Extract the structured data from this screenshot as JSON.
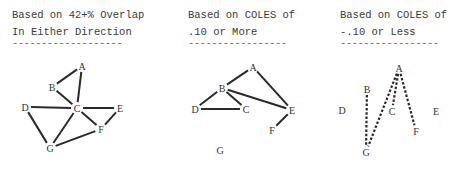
{
  "panels": [
    {
      "title_line1": "Based on 42+% Overlap",
      "title_line2": "In Either Direction",
      "underline": "-------------------",
      "x": 12,
      "line_style": "solid",
      "nodes": {
        "A": [
          82,
          66
        ],
        "B": [
          52,
          87
        ],
        "C": [
          77,
          108
        ],
        "D": [
          25,
          107
        ],
        "E": [
          120,
          108
        ],
        "F": [
          101,
          129
        ],
        "G": [
          50,
          148
        ]
      },
      "edges": [
        [
          "B",
          "A"
        ],
        [
          "A",
          "C"
        ],
        [
          "B",
          "C"
        ],
        [
          "D",
          "C"
        ],
        [
          "C",
          "E"
        ],
        [
          "D",
          "G"
        ],
        [
          "C",
          "G"
        ],
        [
          "C",
          "F"
        ],
        [
          "E",
          "F"
        ],
        [
          "G",
          "F"
        ]
      ]
    },
    {
      "title_line1": "Based on COLES of",
      "title_line2": ".10 or More",
      "underline": "-----------------",
      "x": 188,
      "line_style": "solid",
      "nodes": {
        "A": [
          253,
          67
        ],
        "B": [
          222,
          88
        ],
        "C": [
          246,
          109
        ],
        "D": [
          195,
          109
        ],
        "E": [
          292,
          110
        ],
        "F": [
          272,
          130
        ],
        "G": [
          220,
          150
        ]
      },
      "edges": [
        [
          "B",
          "A"
        ],
        [
          "A",
          "E"
        ],
        [
          "B",
          "D"
        ],
        [
          "B",
          "C"
        ],
        [
          "B",
          "E"
        ],
        [
          "D",
          "C"
        ],
        [
          "E",
          "F"
        ]
      ]
    },
    {
      "title_line1": "Based on COLES of",
      "title_line2": "-.10 or Less",
      "underline": "-----------------",
      "x": 340,
      "line_style": "dashed",
      "nodes": {
        "A": [
          399,
          68
        ],
        "B": [
          367,
          89
        ],
        "C": [
          392,
          111
        ],
        "D": [
          342,
          110
        ],
        "E": [
          436,
          111
        ],
        "F": [
          416,
          131
        ],
        "G": [
          366,
          152
        ]
      },
      "edges": [
        [
          "B",
          "G"
        ],
        [
          "A",
          "G"
        ],
        [
          "A",
          "C"
        ],
        [
          "A",
          "F"
        ]
      ]
    }
  ]
}
